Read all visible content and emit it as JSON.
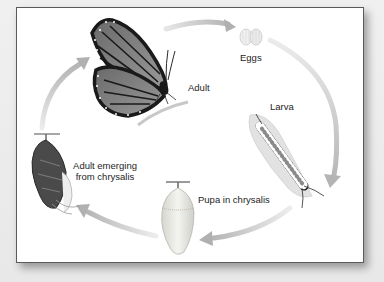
{
  "diagram": {
    "stages": [
      {
        "id": "adult",
        "label": "Adult"
      },
      {
        "id": "eggs",
        "label": "Eggs"
      },
      {
        "id": "larva",
        "label": "Larva"
      },
      {
        "id": "pupa",
        "label": "Pupa in chrysalis"
      },
      {
        "id": "emerging",
        "label_line1": "Adult emerging",
        "label_line2": "from chrysalis"
      }
    ],
    "cycle_order": [
      "Adult",
      "Eggs",
      "Larva",
      "Pupa in chrysalis",
      "Adult emerging from chrysalis"
    ],
    "colors": {
      "frame_border": "#5a5a5a",
      "arrow": "#c8c8c8",
      "background": "#ffffff",
      "page": "#ebebeb"
    }
  }
}
